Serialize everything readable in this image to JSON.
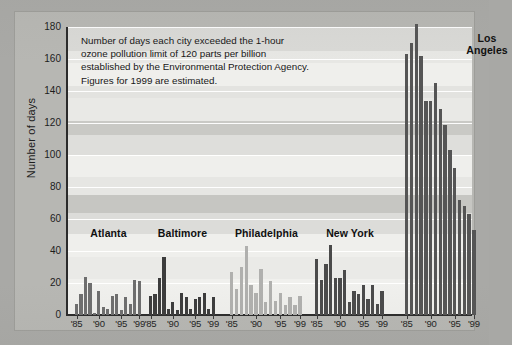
{
  "chart_data": {
    "type": "bar",
    "title": "",
    "caption_lines": [
      "Number of days each city exceeded the 1-hour",
      "ozone pollution limit of 120 parts per billion",
      "established by the Environmental Protection Agency.",
      "Figures for 1999 are estimated."
    ],
    "xlabel": "",
    "ylabel": "Number of days",
    "ylim": [
      0,
      180
    ],
    "ytick_labels": [
      "0",
      "20",
      "40",
      "60",
      "80",
      "100",
      "120",
      "140",
      "160",
      "180"
    ],
    "ytick_values": [
      0,
      20,
      40,
      60,
      80,
      100,
      120,
      140,
      160,
      180
    ],
    "grid": true,
    "legend": "none",
    "x": [
      1985,
      1986,
      1987,
      1988,
      1989,
      1990,
      1991,
      1992,
      1993,
      1994,
      1995,
      1996,
      1997,
      1998,
      1999
    ],
    "xtick_labels": [
      "'85",
      "'90",
      "'95",
      "'99"
    ],
    "xtick_years": [
      1985,
      1990,
      1995,
      1999
    ],
    "series": [
      {
        "name": "Atlanta",
        "color": "#6e6e6e",
        "values": [
          7,
          13,
          24,
          20,
          1,
          15,
          5,
          4,
          12,
          13,
          3,
          11,
          7,
          22,
          21
        ]
      },
      {
        "name": "Baltimore",
        "color": "#3c3c3c",
        "values": [
          12,
          13,
          23,
          36,
          4,
          8,
          3,
          14,
          11,
          4,
          10,
          11,
          14,
          4,
          11
        ]
      },
      {
        "name": "Philadelphia",
        "color": "#b0b0ae",
        "values": [
          27,
          16,
          30,
          43,
          19,
          14,
          29,
          8,
          21,
          9,
          14,
          6,
          11,
          6,
          12
        ]
      },
      {
        "name": "New York",
        "color": "#4a4a4a",
        "values": [
          35,
          22,
          32,
          44,
          23,
          23,
          28,
          8,
          15,
          13,
          19,
          10,
          19,
          7,
          15
        ]
      },
      {
        "name": "Los Angeles",
        "color": "#555555",
        "values": [
          163,
          170,
          182,
          162,
          134,
          134,
          145,
          129,
          119,
          103,
          92,
          72,
          68,
          63,
          53
        ]
      }
    ]
  },
  "group_labels": {
    "atlanta": "Atlanta",
    "baltimore": "Baltimore",
    "philadelphia": "Philadelphia",
    "newyork": "New York",
    "losangeles_line1": "Los",
    "losangeles_line2": "Angeles"
  },
  "axis": {
    "y_title": "Number of days"
  },
  "colors": {
    "background": "#a9a9a6",
    "panel": "#e9e9e6",
    "gridline": "#ffffff",
    "axis": "#2b2b2b",
    "text": "#1d1d1d"
  }
}
